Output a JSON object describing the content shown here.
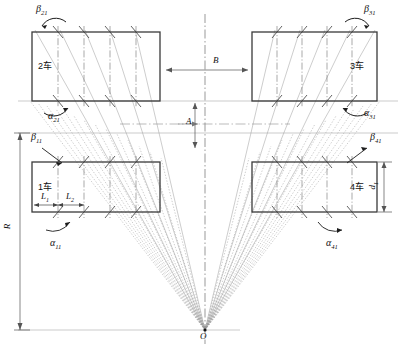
{
  "figure": {
    "type": "engineering-schematic",
    "origin_label": "O",
    "cars": [
      {
        "id": "car2",
        "label": "2车",
        "quadrant": "upper-left",
        "box": {
          "x": 32,
          "y": 32,
          "w": 128,
          "h": 69
        },
        "beta": "β",
        "beta_sub": "21",
        "alpha": "α",
        "alpha_sub": "21"
      },
      {
        "id": "car3",
        "label": "3车",
        "quadrant": "upper-right",
        "box": {
          "x": 252,
          "y": 32,
          "w": 125,
          "h": 69
        },
        "beta": "β",
        "beta_sub": "31",
        "alpha": "α",
        "alpha_sub": "31"
      },
      {
        "id": "car1",
        "label": "1车",
        "quadrant": "lower-left",
        "box": {
          "x": 32,
          "y": 162,
          "w": 128,
          "h": 50
        },
        "beta": "β",
        "beta_sub": "11",
        "alpha": "α",
        "alpha_sub": "11"
      },
      {
        "id": "car4",
        "label": "4车",
        "quadrant": "lower-right",
        "box": {
          "x": 252,
          "y": 162,
          "w": 125,
          "h": 50
        },
        "beta": "β",
        "beta_sub": "41",
        "alpha": "α",
        "alpha_sub": "41"
      }
    ],
    "dimensions": [
      {
        "name": "B",
        "symbol": "B",
        "sub": "",
        "orientation": "horizontal",
        "note": "gap between upper-left and upper-right car blocks"
      },
      {
        "name": "A",
        "symbol": "A",
        "sub": "",
        "orientation": "vertical",
        "note": "vertical offset between upper and lower rows"
      },
      {
        "name": "R",
        "symbol": "R",
        "sub": "",
        "orientation": "vertical",
        "note": "radius from top reference line down to origin O level"
      },
      {
        "name": "L1",
        "symbol": "L",
        "sub": "1",
        "orientation": "horizontal",
        "note": "first pitch inside car 1"
      },
      {
        "name": "L2",
        "symbol": "L",
        "sub": "2",
        "orientation": "horizontal",
        "note": "second pitch inside car 1"
      },
      {
        "name": "d1",
        "symbol": "d",
        "sub": "1",
        "orientation": "vertical",
        "note": "height of car 4 block"
      }
    ],
    "angle_labels": [
      {
        "id": "b21",
        "symbol": "β",
        "sub": "21"
      },
      {
        "id": "a21",
        "symbol": "α",
        "sub": "21"
      },
      {
        "id": "b31",
        "symbol": "β",
        "sub": "31"
      },
      {
        "id": "a31",
        "symbol": "α",
        "sub": "31"
      },
      {
        "id": "b11",
        "symbol": "β",
        "sub": "11"
      },
      {
        "id": "a11",
        "symbol": "α",
        "sub": "11"
      },
      {
        "id": "b41",
        "symbol": "β",
        "sub": "41"
      },
      {
        "id": "a41",
        "symbol": "α",
        "sub": "41"
      }
    ],
    "colors": {
      "box_stroke": "#3a3a3a",
      "radial_line": "#8c8c8c",
      "dash_dot": "#6e6e6e",
      "dimension": "#555555",
      "text": "#111111"
    }
  }
}
